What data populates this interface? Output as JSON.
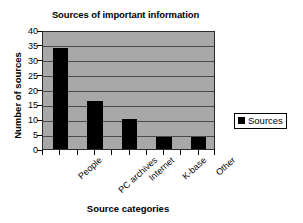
{
  "chart_data": {
    "type": "bar",
    "title": "Sources of important information",
    "xlabel": "Source categories",
    "ylabel": "Number of sources",
    "categories": [
      "People",
      "PC archives",
      "Internet",
      "K-base",
      "Other"
    ],
    "values": [
      34,
      16,
      10,
      4,
      4
    ],
    "series": [
      {
        "name": "Sources",
        "values": [
          34,
          16,
          10,
          4,
          4
        ]
      }
    ],
    "ylim": [
      0,
      40
    ],
    "ytick_labels": [
      "0",
      "5",
      "10",
      "15",
      "20",
      "25",
      "30",
      "35",
      "40"
    ],
    "ytick_values": [
      0,
      5,
      10,
      15,
      20,
      25,
      30,
      35,
      40
    ],
    "grid": true,
    "legend_position": "right",
    "legend_entries": [
      "Sources"
    ],
    "colors": {
      "bar": "#000000",
      "plot_background": "#a8a8a8",
      "gridline": "#4a4a4a",
      "axis": "#2b2b2b",
      "page_background": "#ffffff",
      "text": "#000000"
    }
  },
  "legend": {
    "marker_name": "legend-color-swatch",
    "label": "Sources"
  }
}
